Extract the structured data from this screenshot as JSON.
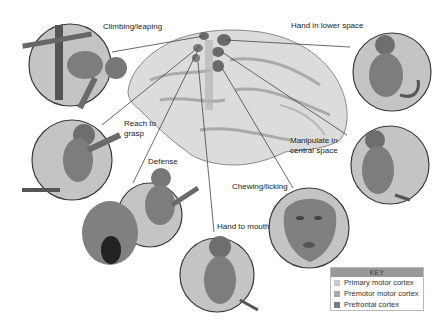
{
  "figure": {
    "behaviors": [
      {
        "id": "climbing",
        "label": "Climbing/leaping",
        "area": "Primary motor cortex"
      },
      {
        "id": "hand-lower",
        "label": "Hand in lower space",
        "area": "Primary motor cortex"
      },
      {
        "id": "reach",
        "label": "Reach to\ngrasp",
        "area": "Premotor motor cortex"
      },
      {
        "id": "manipulate",
        "label": "Manipulate in\ncentral space",
        "area": "Premotor motor cortex"
      },
      {
        "id": "defense",
        "label": "Defense",
        "area": "Premotor motor cortex"
      },
      {
        "id": "chewing",
        "label": "Chewing/licking",
        "area": "Premotor motor cortex"
      },
      {
        "id": "hand-mouth",
        "label": "Hand to mouth",
        "area": "Premotor motor cortex"
      }
    ]
  },
  "key": {
    "title": "KEY",
    "items": [
      {
        "label": "Primary motor cortex",
        "color": "#c8c8c8"
      },
      {
        "label": "Premotor motor cortex",
        "color": "#a9a9a9"
      },
      {
        "label": "Prefrontal cortex",
        "color": "#7a7a7a"
      }
    ]
  },
  "colors": {
    "circle_fill": "#c4c4c4",
    "circle_stroke": "#3a3a3a",
    "brain_fill": "#d9d9d9",
    "brain_shade": "#a8a8a8",
    "region_dark": "#6a6a6a",
    "monkey_body": "#7d7d7d",
    "leader_line": "#444444"
  }
}
